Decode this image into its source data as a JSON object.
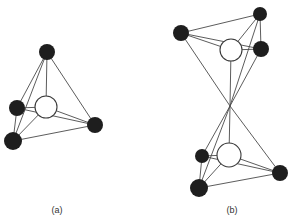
{
  "figure": {
    "panels": [
      {
        "label": "(a)",
        "description": "tetrahedral arrangement: four dark spheres around one central open sphere",
        "label_pos": [
          57,
          213
        ],
        "center": {
          "x": 46,
          "y": 107,
          "r": 11
        },
        "atoms": [
          {
            "x": 47,
            "y": 52,
            "r": 8
          },
          {
            "x": 17,
            "y": 108,
            "r": 8
          },
          {
            "x": 13,
            "y": 141,
            "r": 9
          },
          {
            "x": 95,
            "y": 125,
            "r": 8
          }
        ]
      },
      {
        "label": "(b)",
        "description": "two corner-sharing tetrahedra, each with a central open sphere",
        "label_pos": [
          232,
          213
        ],
        "apex": {
          "x": 230,
          "y": 106
        },
        "upper": {
          "center": {
            "x": 231,
            "y": 50,
            "r": 11
          },
          "atoms": [
            {
              "x": 260,
              "y": 14,
              "r": 7
            },
            {
              "x": 181,
              "y": 33,
              "r": 8
            },
            {
              "x": 261,
              "y": 49,
              "r": 8
            }
          ]
        },
        "lower": {
          "center": {
            "x": 229,
            "y": 155,
            "r": 12
          },
          "atoms": [
            {
              "x": 202,
              "y": 156,
              "r": 7
            },
            {
              "x": 199,
              "y": 188,
              "r": 9
            },
            {
              "x": 280,
              "y": 173,
              "r": 8
            }
          ]
        }
      }
    ]
  }
}
